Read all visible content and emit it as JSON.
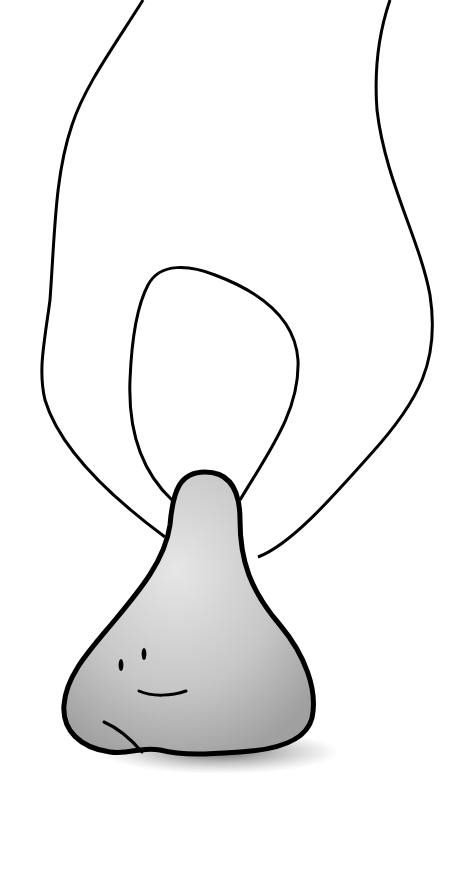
{
  "illustration": {
    "subject": "Cartoon hand pinching a smiling gray nose",
    "colors": {
      "background": "#ffffff",
      "outline": "#000000",
      "nose_fill_light": "#e4e4e4",
      "nose_fill_dark": "#a8a8a8",
      "shadow": "#7a7a7a"
    }
  }
}
